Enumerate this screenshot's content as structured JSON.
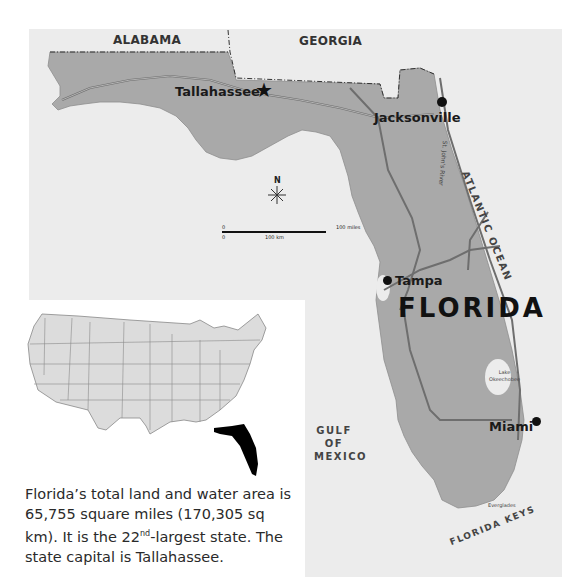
{
  "map": {
    "title": "FLORIDA",
    "neighbors": {
      "alabama": "ALABAMA",
      "georgia": "GEORGIA"
    },
    "cities": [
      {
        "name": "Tallahassee",
        "type": "capital",
        "icon": "star-icon"
      },
      {
        "name": "Jacksonville",
        "type": "city",
        "icon": "city-dot-icon"
      },
      {
        "name": "Tampa",
        "type": "city",
        "icon": "city-dot-icon"
      },
      {
        "name": "Miami",
        "type": "city",
        "icon": "city-dot-icon"
      }
    ],
    "water": {
      "atlantic": "ATLANTIC OCEAN",
      "gulf_line1": "GULF",
      "gulf_line2": "OF",
      "gulf_line3": "MEXICO",
      "keys": "FLORIDA KEYS"
    },
    "features": {
      "river": "St. John's River",
      "lake_line1": "Lake",
      "lake_line2": "Okeechobee",
      "everglades": "Everglades"
    },
    "compass": {
      "label": "N",
      "icon": "compass-rose-icon"
    },
    "scale": {
      "zero_top": "0",
      "zero_bottom": "0",
      "miles": "100 miles",
      "km": "100 km"
    },
    "colors": {
      "land": "#a9a9a9",
      "water": "#ececec",
      "highlight": "#000000",
      "us_states": "#dcdcdc"
    }
  },
  "inset": {
    "highlighted_state": "Florida",
    "description": {
      "part1": "Florida’s total land and water area is 65,755 square miles (170,305 sq km).  It is the 22",
      "sup": "nd",
      "part2": "-largest state. The state capital is Tallahassee."
    }
  }
}
